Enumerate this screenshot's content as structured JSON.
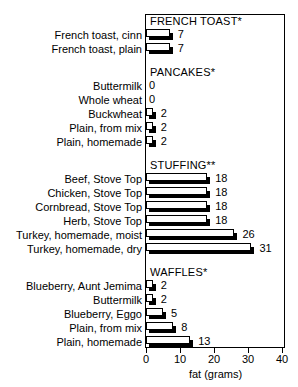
{
  "figure": {
    "cut_off_title": "",
    "frame": true
  },
  "chart_data": {
    "type": "bar",
    "orientation": "horizontal",
    "title": "",
    "xlabel": "fat (grams)",
    "ylabel": "",
    "xlim": [
      0,
      40
    ],
    "xticks": [
      0,
      10,
      20,
      30,
      40
    ],
    "grid": false,
    "legend": "none",
    "value_labels": true,
    "groups": [
      {
        "header": "FRENCH TOAST*",
        "categories": [
          "French toast, cinn",
          "French toast, plain"
        ],
        "values": [
          7,
          7
        ]
      },
      {
        "header": "PANCAKES*",
        "categories": [
          "Buttermilk",
          "Whole wheat",
          "Buckwheat",
          "Plain, from mix",
          "Plain, homemade"
        ],
        "values": [
          0,
          0,
          2,
          2,
          2
        ]
      },
      {
        "header": "STUFFING**",
        "categories": [
          "Beef, Stove Top",
          "Chicken, Stove Top",
          "Cornbread, Stove Top",
          "Herb, Stove Top",
          "Turkey, homemade, moist",
          "Turkey, homemade, dry"
        ],
        "values": [
          18,
          18,
          18,
          18,
          26,
          31
        ]
      },
      {
        "header": "WAFFLES*",
        "categories": [
          "Blueberry, Aunt Jemima",
          "Buttermilk",
          "Blueberry, Eggo",
          "Plain, from mix",
          "Plain, homemade"
        ],
        "values": [
          2,
          2,
          5,
          8,
          13
        ]
      }
    ],
    "categories": [
      "French toast, cinn",
      "French toast, plain",
      "Buttermilk",
      "Whole wheat",
      "Buckwheat",
      "Plain, from mix",
      "Plain, homemade",
      "Beef, Stove Top",
      "Chicken, Stove Top",
      "Cornbread, Stove Top",
      "Herb, Stove Top",
      "Turkey, homemade, moist",
      "Turkey, homemade, dry",
      "Blueberry, Aunt Jemima",
      "Buttermilk",
      "Blueberry, Eggo",
      "Plain, from mix",
      "Plain, homemade"
    ],
    "values": [
      7,
      7,
      0,
      0,
      2,
      2,
      2,
      18,
      18,
      18,
      18,
      26,
      31,
      2,
      2,
      5,
      8,
      13
    ],
    "colors": {
      "bar_fill": "#ffffff",
      "bar_outline": "#000000",
      "bar_shadow": "#000000",
      "text": "#000000",
      "background": "#ffffff"
    }
  }
}
